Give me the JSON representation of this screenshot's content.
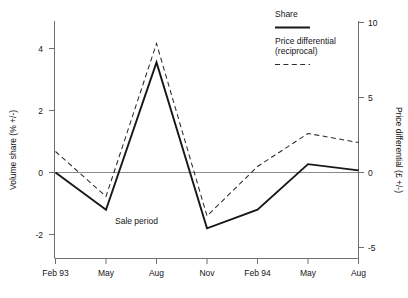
{
  "chart_data": {
    "type": "line",
    "title": "",
    "subtitle": "",
    "xlabel": "",
    "ylabel": "Volume share (% +/-)",
    "y2label": "Price differential (£ +/-)",
    "grid": false,
    "legend_position": "top-right",
    "categories": [
      "Feb 93",
      "May",
      "Aug",
      "Nov",
      "Feb 94",
      "May",
      "Aug"
    ],
    "x_tick_labels": [
      "Feb 93",
      "May",
      "Aug",
      "Nov",
      "Feb 94",
      "May",
      "Aug"
    ],
    "y_tick_labels": [
      "4",
      "2",
      "0",
      "-2"
    ],
    "y_ticks": [
      4,
      2,
      0,
      -2
    ],
    "ylim": [
      -2.85,
      4.75
    ],
    "y2_tick_labels": [
      "10",
      "5",
      "0",
      "-5"
    ],
    "y2_ticks": [
      10,
      5,
      0,
      -5
    ],
    "y2lim": [
      -6.2,
      11.3
    ],
    "series": [
      {
        "name": "Share",
        "axis": "left",
        "style": "solid",
        "color": "#171717",
        "values": [
          0.0,
          -1.2,
          3.55,
          -1.8,
          -1.2,
          0.27,
          0.07
        ]
      },
      {
        "name": "Price differential (reciprocal)",
        "axis": "right",
        "style": "dashed",
        "color": "#2b2b2b",
        "values": [
          1.4,
          -1.6,
          8.6,
          -2.9,
          0.4,
          2.6,
          2.0
        ]
      }
    ],
    "annotations": [
      {
        "text": "Sale period",
        "x_category": "Aug",
        "y_value": -1.55
      }
    ],
    "zero_reference_line": 0
  },
  "legend": {
    "entries": [
      {
        "label": "Share",
        "style": "solid"
      },
      {
        "label": "Price differential",
        "label_line2": "(reciprocal)",
        "style": "dashed"
      }
    ]
  },
  "axes": {
    "left_title": "Volume share (% +/-)",
    "right_title": "Price differential (£ +/-)"
  },
  "colors": {
    "background": "#ffffff",
    "axis": "#6e6e6e",
    "zero_line": "#8a8a8a",
    "series_solid": "#171717",
    "series_dashed": "#2b2b2b",
    "text": "#141414"
  }
}
